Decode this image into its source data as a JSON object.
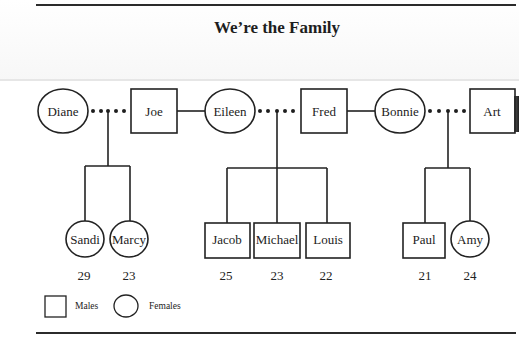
{
  "title": "We’re the Family",
  "diagram_type": "family-tree",
  "parents": [
    {
      "name": "Diane",
      "sex": "female"
    },
    {
      "name": "Joe",
      "sex": "male"
    },
    {
      "name": "Eileen",
      "sex": "female"
    },
    {
      "name": "Fred",
      "sex": "male"
    },
    {
      "name": "Bonnie",
      "sex": "female"
    },
    {
      "name": "Art",
      "sex": "male"
    }
  ],
  "unions": [
    {
      "partners": [
        "Diane",
        "Joe"
      ],
      "link": "dotted",
      "children": [
        "Sandi",
        "Marcy"
      ]
    },
    {
      "partners": [
        "Joe",
        "Eileen"
      ],
      "link": "solid",
      "children": []
    },
    {
      "partners": [
        "Eileen",
        "Fred"
      ],
      "link": "dotted",
      "children": [
        "Jacob",
        "Michael",
        "Louis"
      ]
    },
    {
      "partners": [
        "Fred",
        "Bonnie"
      ],
      "link": "solid",
      "children": []
    },
    {
      "partners": [
        "Bonnie",
        "Art"
      ],
      "link": "dotted",
      "children": [
        "Paul",
        "Amy"
      ]
    }
  ],
  "children": [
    {
      "name": "Sandi",
      "sex": "female",
      "age": "29"
    },
    {
      "name": "Marcy",
      "sex": "female",
      "age": "23"
    },
    {
      "name": "Jacob",
      "sex": "male",
      "age": "25"
    },
    {
      "name": "Michael",
      "sex": "male",
      "age": "23"
    },
    {
      "name": "Louis",
      "sex": "male",
      "age": "22"
    },
    {
      "name": "Paul",
      "sex": "male",
      "age": "21"
    },
    {
      "name": "Amy",
      "sex": "female",
      "age": "24"
    }
  ],
  "legend": {
    "male_label": "Males",
    "female_label": "Females"
  }
}
